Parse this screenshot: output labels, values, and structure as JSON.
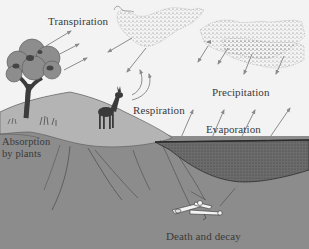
{
  "diagram": {
    "labels": {
      "transpiration": "Transpiration",
      "respiration": "Respiration",
      "precipitation": "Precipitation",
      "evaporation": "Evaporation",
      "absorption_line1": "Absorption",
      "absorption_line2": "by plants",
      "death_decay": "Death and decay"
    },
    "elements": [
      {
        "name": "tree",
        "kind": "illustration"
      },
      {
        "name": "deer",
        "kind": "illustration"
      },
      {
        "name": "clouds",
        "kind": "illustration"
      },
      {
        "name": "lake",
        "kind": "illustration"
      },
      {
        "name": "bones",
        "kind": "illustration"
      },
      {
        "name": "ground-cross-section",
        "kind": "illustration"
      }
    ],
    "flows": [
      {
        "from": "tree",
        "to": "air",
        "label": "Transpiration",
        "arrows": 3
      },
      {
        "from": "clouds",
        "to": "ground",
        "label": "Precipitation",
        "arrows": 5
      },
      {
        "from": "lake",
        "to": "clouds",
        "label": "Evaporation",
        "arrows": 4
      },
      {
        "from": "deer",
        "to": "air",
        "label": "Respiration",
        "arrows": 2
      },
      {
        "from": "soil",
        "to": "tree",
        "label": "Absorption by plants"
      },
      {
        "from": "bones",
        "to": "soil",
        "label": "Death and decay"
      }
    ],
    "colors": {
      "sky": "#f3f3f3",
      "ground": "#8a8a8a",
      "ground_surface": "#a9a9a9",
      "lake": "#6e6e6e",
      "arrows": "#8c8c8c",
      "text": "#3a3a3a"
    }
  }
}
